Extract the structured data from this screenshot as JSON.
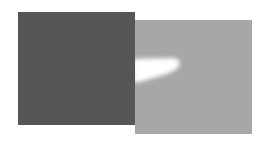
{
  "figure": {
    "colors": {
      "background": "#ffffff",
      "dark_square": "#565656",
      "light_square": "#a7a7a7",
      "highlight": "#ffffff"
    }
  }
}
